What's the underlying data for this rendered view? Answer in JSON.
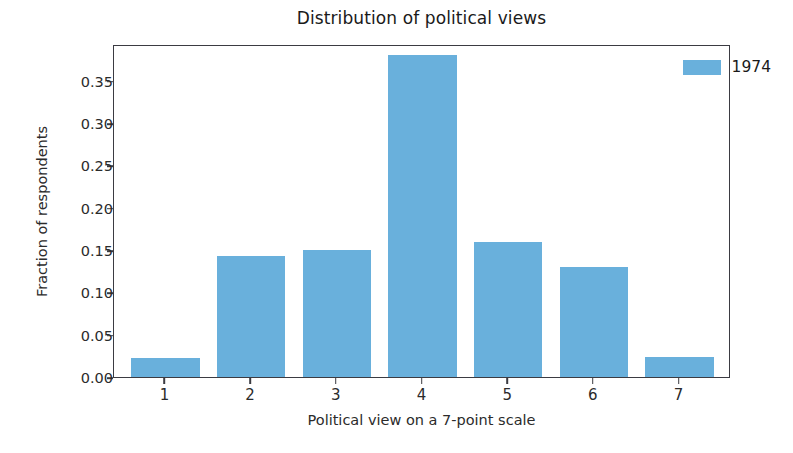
{
  "chart_data": {
    "type": "bar",
    "title": "Distribution of political views",
    "xlabel": "Political view on a 7-point scale",
    "ylabel": "Fraction of respondents",
    "categories": [
      "1",
      "2",
      "3",
      "4",
      "5",
      "6",
      "7"
    ],
    "series": [
      {
        "name": "1974",
        "color": "#69b0dc",
        "values": [
          0.022,
          0.143,
          0.15,
          0.38,
          0.16,
          0.13,
          0.024
        ]
      }
    ],
    "ylim": [
      0.0,
      0.3935
    ],
    "xlim": [
      0.4,
      7.6
    ],
    "yticks": [
      0.0,
      0.05,
      0.1,
      0.15,
      0.2,
      0.25,
      0.3,
      0.35
    ],
    "ytick_labels": [
      "0.00",
      "0.05",
      "0.10",
      "0.15",
      "0.20",
      "0.25",
      "0.30",
      "0.35"
    ],
    "xticks": [
      1,
      2,
      3,
      4,
      5,
      6,
      7
    ],
    "grid": false,
    "bar_width": 0.8,
    "legend": {
      "entries": [
        {
          "label": "1974",
          "color": "#69b0dc"
        }
      ],
      "position": "upper right",
      "frame": false
    },
    "axes": {
      "spine_color": "#3b3b42",
      "background": "#ffffff"
    }
  }
}
